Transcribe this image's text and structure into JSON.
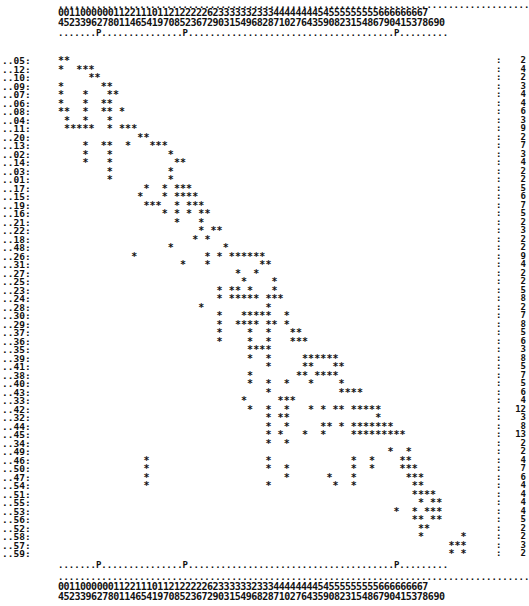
{
  "header": {
    "dots_top": ".......................................................................................",
    "digits_row1": "0011000000112211101121222226233333323334444444454555555555666666667",
    "digits_row2": "4523396278011465419708523672903154968287102764359082315486790415378690",
    "marker_row": ".......P...............P......................................P........."
  },
  "footer": {
    "marker_row": ".......P...............P......................................P.........",
    "dots_row": ".......................................................................................",
    "digits_row1": "0011000000112211101121222226233333323334444444454555555555666666667",
    "digits_row2": "4523396278011465419708523672903154968287102764359082315486790415378690"
  },
  "columns": [
    "04",
    "05",
    "12",
    "13",
    "23",
    "39",
    "06",
    "02",
    "07",
    "08",
    "10",
    "11",
    "14",
    "16",
    "25",
    "24",
    "11",
    "19",
    "17",
    "00",
    "18",
    "15",
    "22",
    "23",
    "26",
    "27",
    "22",
    "26",
    "39",
    "30",
    "23",
    "21",
    "35",
    "34",
    "39",
    "36",
    "38",
    "32",
    "38",
    "37",
    "41",
    "40",
    "42",
    "47",
    "46",
    "44",
    "43",
    "45",
    "49",
    "40",
    "58",
    "52",
    "53",
    "51",
    "55",
    "54",
    "58",
    "56",
    "57",
    "59",
    "60",
    "64",
    "61",
    "65",
    "63",
    "67",
    "68",
    "66",
    "69",
    "70"
  ],
  "rows": [
    {
      "label": "05",
      "cols": [
        0,
        1
      ],
      "count": "2"
    },
    {
      "label": "12",
      "cols": [
        0,
        3,
        4,
        5
      ],
      "count": "4"
    },
    {
      "label": "10",
      "cols": [
        5,
        6
      ],
      "count": "2"
    },
    {
      "label": "09",
      "cols": [
        0,
        7,
        8
      ],
      "count": "3"
    },
    {
      "label": "07",
      "cols": [
        0,
        4,
        8,
        9
      ],
      "count": "4"
    },
    {
      "label": "06",
      "cols": [
        0,
        4,
        7,
        8
      ],
      "count": "4"
    },
    {
      "label": "08",
      "cols": [
        0,
        1,
        4,
        7,
        8,
        10
      ],
      "count": "6"
    },
    {
      "label": "04",
      "cols": [
        1,
        4,
        8
      ],
      "count": "3"
    },
    {
      "label": "11",
      "cols": [
        1,
        2,
        3,
        4,
        5,
        8,
        10,
        11,
        12
      ],
      "count": "9"
    },
    {
      "label": "20",
      "cols": [
        13,
        14
      ],
      "count": "2"
    },
    {
      "label": "13",
      "cols": [
        4,
        7,
        8,
        11,
        15,
        16,
        17
      ],
      "count": "7"
    },
    {
      "label": "02",
      "cols": [
        4,
        8,
        18
      ],
      "count": "3"
    },
    {
      "label": "14",
      "cols": [
        4,
        8,
        19,
        20
      ],
      "count": "4"
    },
    {
      "label": "03",
      "cols": [
        8,
        18
      ],
      "count": "2"
    },
    {
      "label": "01",
      "cols": [
        8,
        18
      ],
      "count": "2"
    },
    {
      "label": "17",
      "cols": [
        14,
        17,
        19,
        20,
        21
      ],
      "count": "5"
    },
    {
      "label": "15",
      "cols": [
        13,
        17,
        19,
        20,
        21,
        22
      ],
      "count": "6"
    },
    {
      "label": "19",
      "cols": [
        14,
        15,
        16,
        19,
        21,
        22,
        23
      ],
      "count": "7"
    },
    {
      "label": "16",
      "cols": [
        17,
        19,
        21,
        23,
        24
      ],
      "count": "5"
    },
    {
      "label": "21",
      "cols": [
        19,
        23
      ],
      "count": "2"
    },
    {
      "label": "22",
      "cols": [
        23,
        25,
        26
      ],
      "count": "3"
    },
    {
      "label": "18",
      "cols": [
        22,
        24
      ],
      "count": "2"
    },
    {
      "label": "48",
      "cols": [
        18,
        27
      ],
      "count": "2"
    },
    {
      "label": "26",
      "cols": [
        12,
        24,
        26,
        28,
        29,
        30,
        31,
        32,
        33
      ],
      "count": "9"
    },
    {
      "label": "31",
      "cols": [
        20,
        24,
        33,
        34
      ],
      "count": "4"
    },
    {
      "label": "27",
      "cols": [
        29,
        32
      ],
      "count": "2"
    },
    {
      "label": "25",
      "cols": [
        30,
        35
      ],
      "count": "2"
    },
    {
      "label": "23",
      "cols": [
        26,
        28,
        29,
        31,
        35
      ],
      "count": "5"
    },
    {
      "label": "24",
      "cols": [
        26,
        28,
        29,
        30,
        31,
        32,
        34,
        35,
        36
      ],
      "count": "8"
    },
    {
      "label": "28",
      "cols": [
        23,
        34
      ],
      "count": "2"
    },
    {
      "label": "30",
      "cols": [
        26,
        30,
        31,
        32,
        33,
        34,
        37
      ],
      "count": "7"
    },
    {
      "label": "29",
      "cols": [
        26,
        29,
        30,
        31,
        32,
        34,
        35,
        37
      ],
      "count": "8"
    },
    {
      "label": "37",
      "cols": [
        26,
        31,
        34,
        38,
        39
      ],
      "count": "5"
    },
    {
      "label": "36",
      "cols": [
        26,
        31,
        34,
        38,
        39,
        40
      ],
      "count": "6"
    },
    {
      "label": "35",
      "cols": [
        31,
        32,
        33,
        34
      ],
      "count": "3"
    },
    {
      "label": "39",
      "cols": [
        31,
        34,
        40,
        41,
        42,
        43,
        44,
        45
      ],
      "count": "8"
    },
    {
      "label": "41",
      "cols": [
        34,
        40,
        41,
        45,
        46
      ],
      "count": "5"
    },
    {
      "label": "38",
      "cols": [
        31,
        39,
        40,
        42,
        43,
        44,
        45
      ],
      "count": "7"
    },
    {
      "label": "40",
      "cols": [
        31,
        34,
        37,
        41,
        46
      ],
      "count": "5"
    },
    {
      "label": "43",
      "cols": [
        34,
        46,
        47,
        48,
        49
      ],
      "count": "6"
    },
    {
      "label": "33",
      "cols": [
        30,
        36,
        37,
        38
      ],
      "count": "4"
    },
    {
      "label": "42",
      "cols": [
        31,
        34,
        37,
        41,
        43,
        45,
        46,
        48,
        49,
        50,
        51,
        52
      ],
      "count": "12"
    },
    {
      "label": "32",
      "cols": [
        34,
        36,
        37,
        52
      ],
      "count": "3"
    },
    {
      "label": "44",
      "cols": [
        34,
        37,
        43,
        44,
        46,
        48,
        49,
        50,
        51,
        52,
        53,
        54
      ],
      "count": "8"
    },
    {
      "label": "45",
      "cols": [
        34,
        36,
        40,
        43,
        48,
        49,
        50,
        51,
        52,
        53,
        54,
        55,
        56
      ],
      "count": "13"
    },
    {
      "label": "34",
      "cols": [
        34,
        37
      ],
      "count": "2"
    },
    {
      "label": "49",
      "cols": [
        54,
        57
      ],
      "count": "2"
    },
    {
      "label": "46",
      "cols": [
        14,
        34,
        48,
        51,
        56,
        57
      ],
      "count": "4"
    },
    {
      "label": "50",
      "cols": [
        14,
        34,
        37,
        48,
        51,
        56,
        57,
        58
      ],
      "count": "7"
    },
    {
      "label": "47",
      "cols": [
        14,
        37,
        44,
        48,
        57,
        58,
        59
      ],
      "count": "6"
    },
    {
      "label": "54",
      "cols": [
        14,
        34,
        45,
        48,
        58,
        59
      ],
      "count": "4"
    },
    {
      "label": "51",
      "cols": [
        58,
        59,
        60,
        61
      ],
      "count": "4"
    },
    {
      "label": "55",
      "cols": [
        59,
        61,
        62
      ],
      "count": "4"
    },
    {
      "label": "53",
      "cols": [
        55,
        58,
        60,
        61,
        62
      ],
      "count": "4"
    },
    {
      "label": "56",
      "cols": [
        58,
        59,
        61,
        62
      ],
      "count": "5"
    },
    {
      "label": "52",
      "cols": [
        59,
        60
      ],
      "count": "2"
    },
    {
      "label": "58",
      "cols": [
        59,
        66
      ],
      "count": "2"
    },
    {
      "label": "57",
      "cols": [
        64,
        65,
        66
      ],
      "count": "3"
    },
    {
      "label": "59",
      "cols": [
        64,
        66
      ],
      "count": "2"
    }
  ]
}
